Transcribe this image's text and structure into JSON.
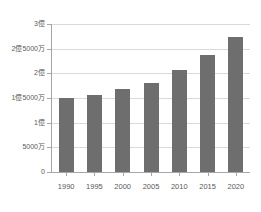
{
  "chart_data": {
    "type": "bar",
    "title": "",
    "subtitle": "",
    "xlabel": "",
    "ylabel": "",
    "categories": [
      "1990",
      "1995",
      "2000",
      "2005",
      "2010",
      "2015",
      "2020"
    ],
    "values": [
      150000000,
      157000000,
      168000000,
      180000000,
      207000000,
      237000000,
      274000000
    ],
    "series": [
      {
        "name": "",
        "values": [
          150000000,
          157000000,
          168000000,
          180000000,
          207000000,
          237000000,
          274000000
        ]
      }
    ],
    "ylim": [
      0,
      300000000
    ],
    "xlim": null,
    "y_ticks": [
      0,
      50000000,
      100000000,
      150000000,
      200000000,
      250000000,
      300000000
    ],
    "y_tick_labels": [
      "0",
      "5000万",
      "1億",
      "1億5000万",
      "2億",
      "2億5000万",
      "3億"
    ],
    "x_tick_labels": [
      "1990",
      "1995",
      "2000",
      "2005",
      "2010",
      "2015",
      "2020"
    ],
    "grid": true,
    "grid_axis": "y",
    "legend": false,
    "legend_position": "none",
    "annotations": [],
    "colors": {
      "bar": "#6e6e6e",
      "grid": "#d9d9d9",
      "axis": "#a6a6a6",
      "tick_label": "#595959",
      "background": "#ffffff"
    }
  }
}
